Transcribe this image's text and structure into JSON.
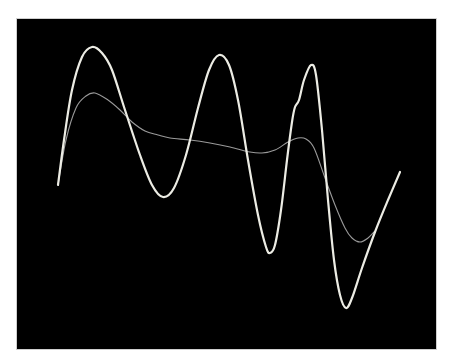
{
  "chart_data": {
    "type": "line",
    "title": "",
    "xlabel": "",
    "ylabel": "",
    "grid": false,
    "legend": null,
    "background": "#000000",
    "series": [
      {
        "name": "waveform-primary",
        "color": "#ecece4",
        "width": 2.2,
        "points": [
          [
            58,
            185
          ],
          [
            64,
            140
          ],
          [
            72,
            90
          ],
          [
            82,
            57
          ],
          [
            92,
            47
          ],
          [
            102,
            53
          ],
          [
            112,
            70
          ],
          [
            125,
            110
          ],
          [
            140,
            155
          ],
          [
            152,
            185
          ],
          [
            163,
            197
          ],
          [
            174,
            188
          ],
          [
            186,
            155
          ],
          [
            198,
            108
          ],
          [
            209,
            70
          ],
          [
            219,
            55
          ],
          [
            229,
            65
          ],
          [
            238,
            100
          ],
          [
            248,
            160
          ],
          [
            258,
            215
          ],
          [
            266,
            247
          ],
          [
            270,
            253
          ],
          [
            275,
            245
          ],
          [
            281,
            210
          ],
          [
            287,
            160
          ],
          [
            292,
            122
          ],
          [
            295,
            107
          ],
          [
            299,
            100
          ],
          [
            304,
            80
          ],
          [
            311,
            65
          ],
          [
            316,
            75
          ],
          [
            322,
            130
          ],
          [
            328,
            200
          ],
          [
            334,
            260
          ],
          [
            340,
            295
          ],
          [
            346,
            308
          ],
          [
            352,
            298
          ],
          [
            362,
            268
          ],
          [
            375,
            232
          ],
          [
            388,
            200
          ],
          [
            400,
            172
          ]
        ]
      },
      {
        "name": "waveform-secondary",
        "color": "#9a9a9a",
        "width": 1.1,
        "points": [
          [
            58,
            185
          ],
          [
            66,
            140
          ],
          [
            76,
            108
          ],
          [
            86,
            96
          ],
          [
            95,
            93
          ],
          [
            108,
            100
          ],
          [
            120,
            110
          ],
          [
            132,
            122
          ],
          [
            145,
            131
          ],
          [
            158,
            135
          ],
          [
            170,
            138
          ],
          [
            190,
            140
          ],
          [
            210,
            143
          ],
          [
            230,
            147
          ],
          [
            250,
            152
          ],
          [
            262,
            153
          ],
          [
            275,
            150
          ],
          [
            288,
            142
          ],
          [
            298,
            138
          ],
          [
            306,
            139
          ],
          [
            314,
            148
          ],
          [
            325,
            178
          ],
          [
            335,
            205
          ],
          [
            345,
            228
          ],
          [
            352,
            238
          ],
          [
            360,
            242
          ],
          [
            368,
            238
          ],
          [
            374,
            232
          ]
        ]
      }
    ]
  },
  "display": {
    "frame_left": 17,
    "frame_top": 19,
    "frame_width": 419,
    "frame_height": 330
  }
}
